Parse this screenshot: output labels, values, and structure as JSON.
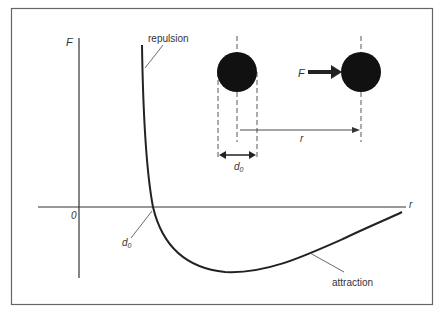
{
  "diagram": {
    "axes": {
      "y_label": "F",
      "x_label": "r",
      "origin_label": "0"
    },
    "curve_labels": {
      "repulsion": "repulsion",
      "attraction": "attraction",
      "d0": "d",
      "d0_sub": "0"
    },
    "inset": {
      "force_label": "F",
      "separation_label": "r",
      "diameter_label": "d",
      "diameter_sub": "0"
    },
    "colors": {
      "line": "#222222",
      "frame": "#555555",
      "particle": "#111111"
    }
  }
}
